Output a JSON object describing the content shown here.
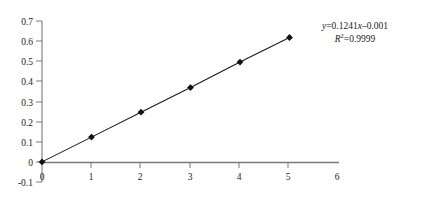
{
  "chart_data": {
    "type": "scatter",
    "title": "",
    "xlabel": "",
    "ylabel": "",
    "x": [
      0,
      1,
      2,
      3,
      4,
      5
    ],
    "values": [
      0,
      0.123,
      0.247,
      0.369,
      0.496,
      0.618
    ],
    "series": [
      {
        "name": "calibration-series",
        "x": [
          0,
          1,
          2,
          3,
          4,
          5
        ],
        "values": [
          0,
          0.123,
          0.247,
          0.369,
          0.496,
          0.618
        ]
      }
    ],
    "xlim": [
      0,
      6
    ],
    "ylim": [
      -0.1,
      0.7
    ],
    "xticks": [
      0,
      1,
      2,
      3,
      4,
      5,
      6
    ],
    "yticks": [
      -0.1,
      0,
      0.1,
      0.2,
      0.3,
      0.4,
      0.5,
      0.6,
      0.7
    ],
    "xtick_labels": [
      "0",
      "1",
      "2",
      "3",
      "4",
      "5",
      "6"
    ],
    "ytick_labels": [
      "-0.1",
      "0",
      "0.1",
      "0.2",
      "0.3",
      "0.4",
      "0.5",
      "0.6",
      "0.7"
    ],
    "grid": false,
    "legend": null,
    "marker": "diamond",
    "trendline": {
      "slope": 0.1241,
      "intercept": -0.001,
      "r_squared": 0.9999
    },
    "annotations": {
      "equation_y": "y",
      "equation_body": "=0.1241",
      "equation_x": "x",
      "equation_tail": "–0.001",
      "equation_full": "y=0.1241x–0.001",
      "r2_symbol": "R",
      "r2_exponent": "2",
      "r2_value": "=0.9999",
      "r2_full": "R²=0.9999"
    }
  },
  "colors": {
    "axis": "#7a7a7a",
    "series_line": "#1a1a1a",
    "marker": "#111111",
    "text": "#1b1b1b",
    "background": "#ffffff"
  }
}
